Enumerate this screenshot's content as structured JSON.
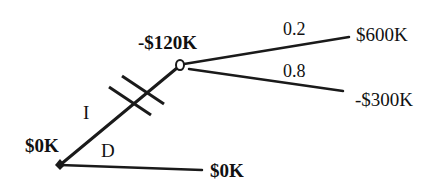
{
  "diagram": {
    "type": "decision-tree",
    "colors": {
      "line": "#1a1a1a",
      "background": "#ffffff"
    },
    "root": {
      "kind": "decision-node",
      "value_label": "$0K",
      "branches": [
        {
          "label": "I",
          "blocked": true,
          "blocked_marker": "double-hash",
          "child": {
            "kind": "chance-node",
            "value_label": "-$120K",
            "outcomes": [
              {
                "probability": "0.2",
                "payoff": "$600K"
              },
              {
                "probability": "0.8",
                "payoff": "-$300K"
              }
            ]
          }
        },
        {
          "label": "D",
          "blocked": false,
          "child": {
            "kind": "terminal",
            "payoff": "$0K"
          }
        }
      ]
    }
  }
}
